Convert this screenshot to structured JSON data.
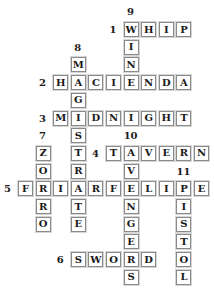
{
  "puzzle": {
    "layout": {
      "origin_x": 18,
      "origin_y": 22,
      "col_pitch": 17.6,
      "row_pitch": 17.7
    },
    "across": [
      {
        "number": "1",
        "answer": "WHIP",
        "row": 0,
        "col": 6
      },
      {
        "number": "2",
        "answer": "HACIENDA",
        "row": 3,
        "col": 2
      },
      {
        "number": "3",
        "answer": "MIDNIGHT",
        "row": 5,
        "col": 2
      },
      {
        "number": "4",
        "answer": "TAVERN",
        "row": 7,
        "col": 5
      },
      {
        "number": "5",
        "answer": "FRIARFELIPE",
        "row": 9,
        "col": 0
      },
      {
        "number": "6",
        "answer": "SWORD",
        "row": 13,
        "col": 3
      }
    ],
    "down": [
      {
        "number": "7",
        "answer": "ZORRO",
        "row": 7,
        "col": 1
      },
      {
        "number": "8",
        "answer": "MAGISTRATE",
        "row": 2,
        "col": 3
      },
      {
        "number": "9",
        "answer": "WINE",
        "row": 0,
        "col": 6
      },
      {
        "number": "10",
        "answer": "AVENGERS",
        "row": 7,
        "col": 6
      },
      {
        "number": "11",
        "answer": "PISTOL",
        "row": 9,
        "col": 9
      }
    ],
    "labels": [
      {
        "text": "1",
        "row": 0,
        "col": 5
      },
      {
        "text": "9",
        "row": -1,
        "col": 6
      },
      {
        "text": "8",
        "row": 1,
        "col": 3
      },
      {
        "text": "2",
        "row": 3,
        "col": 1
      },
      {
        "text": "3",
        "row": 5,
        "col": 1
      },
      {
        "text": "7",
        "row": 6,
        "col": 1
      },
      {
        "text": "10",
        "row": 6,
        "col": 6
      },
      {
        "text": "4",
        "row": 7,
        "col": 4
      },
      {
        "text": "11",
        "row": 8,
        "col": 9
      },
      {
        "text": "5",
        "row": 9,
        "col": -1
      },
      {
        "text": "6",
        "row": 13,
        "col": 2
      }
    ]
  }
}
